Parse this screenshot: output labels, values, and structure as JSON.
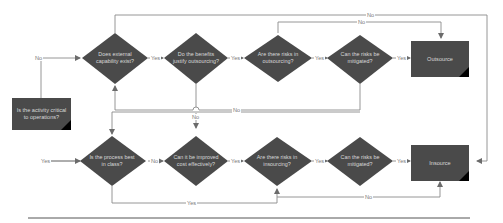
{
  "diagram": {
    "colors": {
      "shape_fill": "#4a4a4a",
      "shape_text": "#d9d9d9",
      "connector": "#808080",
      "corner_accent": "#000000",
      "background": "#ffffff"
    },
    "start_node": {
      "label": "Is the activity critical to operations?"
    },
    "top_row": {
      "decisions": [
        {
          "label": "Does external capability exist?"
        },
        {
          "label": "Do the benefits justify outsourcing?"
        },
        {
          "label": "Are there risks in outsourcing?"
        },
        {
          "label": "Can the risks be mitigated?"
        }
      ],
      "outcome": {
        "label": "Outsource"
      }
    },
    "bottom_row": {
      "decisions": [
        {
          "label": "Is the process best in class?"
        },
        {
          "label": "Can it be improved cost effectively?"
        },
        {
          "label": "Are there risks in insourcing?"
        },
        {
          "label": "Can the risks be mitigated?"
        }
      ],
      "outcome": {
        "label": "Insource"
      }
    },
    "edge_labels": {
      "start_no": "No",
      "start_yes": "Yes",
      "top_d1_yes": "Yes",
      "top_d2_yes": "Yes",
      "top_d3_yes": "Yes",
      "top_d4_yes": "Yes",
      "top_d1_no": "No",
      "top_d3_no": "No",
      "top_d2_no": "No",
      "mid_no": "No",
      "bot_d1_no": "No",
      "bot_d2_yes": "Yes",
      "bot_d3_yes": "Yes",
      "bot_d4_yes": "Yes",
      "bot_d1_yes": "Yes",
      "bot_d4_no": "No"
    }
  }
}
